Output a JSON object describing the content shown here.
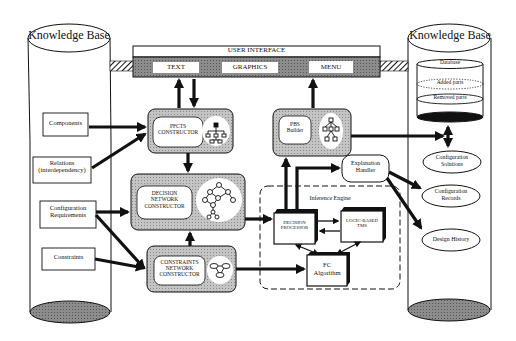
{
  "diagram": {
    "left_kb": {
      "title": "Knowledge Base",
      "items": [
        {
          "id": "components",
          "label": "Components"
        },
        {
          "id": "relations",
          "label_line1": "Relations",
          "label_line2": "(interdependency)"
        },
        {
          "id": "config-req",
          "label_line1": "Configuration",
          "label_line2": "Requirements"
        },
        {
          "id": "constraints",
          "label": "Constraints"
        }
      ]
    },
    "user_interface": {
      "title": "USER   INTERFACE",
      "tabs": [
        "TEXT",
        "GRAPHICS",
        "MENU"
      ]
    },
    "modules": {
      "pfcts": {
        "line1": "PFCTS",
        "line2": "CONSTRUCTOR"
      },
      "decision_network": {
        "line1": "DECISION",
        "line2": "NETWORK",
        "line3": "CONSTRUCTOR"
      },
      "constraints_network": {
        "line1": "CONSTRAINTS",
        "line2": "NETWORK",
        "line3": "CONSTRUCTOR"
      },
      "pbs_builder": {
        "line1": "PBS",
        "line2": "Builder"
      },
      "explanation_handler": {
        "line1": "Explanation",
        "line2": "Handler"
      }
    },
    "inference_engine": {
      "title": "Inference Engine",
      "decision_processor": {
        "line1": "DECISION",
        "line2": "PROCESSOR"
      },
      "logic_tms": {
        "line1": "LOGIC-BASED",
        "line2": "TMS"
      },
      "fc_algorithm": {
        "line1": "FC",
        "line2": "Algorithm"
      }
    },
    "right_kb": {
      "title": "Knowledge Base",
      "database": {
        "title": "Database",
        "added": "Added parts",
        "removed": "Removed parts"
      },
      "outputs": [
        {
          "id": "config-solutions",
          "line1": "Configuration",
          "line2": "Solutions"
        },
        {
          "id": "config-records",
          "line1": "Configuration",
          "line2": "Records"
        },
        {
          "id": "design-history",
          "label": "Design History"
        }
      ]
    },
    "colors": {
      "stroke": "#111111",
      "module_fill": "#b8b8b8",
      "ui_band": "#7a7a7a",
      "cylinder_base": "#9a9a9a",
      "background": "#ffffff"
    }
  }
}
